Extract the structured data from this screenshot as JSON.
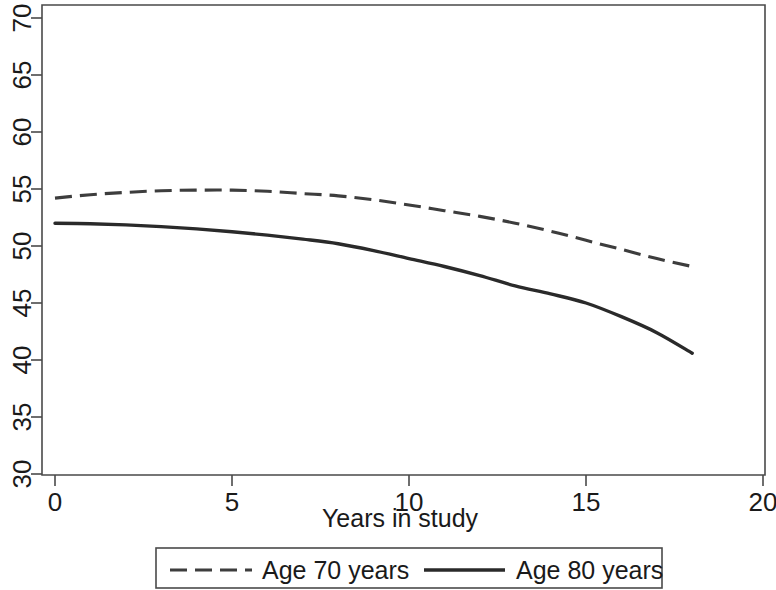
{
  "chart_data": {
    "type": "line",
    "title": "",
    "xlabel": "Years in study",
    "ylabel": "",
    "xlim": [
      0,
      20
    ],
    "ylim": [
      30,
      70
    ],
    "xticks": [
      0,
      5,
      10,
      15,
      20
    ],
    "xtick_labels": [
      "0",
      "5",
      "10",
      "15",
      "20"
    ],
    "yticks": [
      30,
      35,
      40,
      45,
      50,
      55,
      60,
      65,
      70
    ],
    "ytick_labels": [
      "30",
      "35",
      "40",
      "45",
      "50",
      "55",
      "60",
      "65",
      "70"
    ],
    "grid": false,
    "legend_position": "below-axes",
    "x": [
      0,
      1,
      2,
      3,
      4,
      5,
      6,
      7,
      8,
      9,
      10,
      11,
      12,
      13,
      14,
      15,
      16,
      17,
      18
    ],
    "series": [
      {
        "name": "Age 70 years",
        "style": "dashed",
        "color": "#3d3d3d",
        "values": [
          54.2,
          54.5,
          54.7,
          54.85,
          54.9,
          54.9,
          54.8,
          54.6,
          54.4,
          54.05,
          53.6,
          53.1,
          52.6,
          52.0,
          51.3,
          50.5,
          49.7,
          48.9,
          48.2
        ]
      },
      {
        "name": "Age 80 years",
        "style": "solid",
        "color": "#2a2a2a",
        "values": [
          52.0,
          51.95,
          51.85,
          51.7,
          51.5,
          51.25,
          50.95,
          50.6,
          50.2,
          49.6,
          48.9,
          48.2,
          47.4,
          46.5,
          45.8,
          45.0,
          43.8,
          42.4,
          40.6
        ]
      }
    ],
    "legend": [
      {
        "label": "Age 70 years",
        "style": "dashed"
      },
      {
        "label": "Age 80 years",
        "style": "solid"
      }
    ]
  },
  "geometry": {
    "plot_left": 42,
    "plot_right": 765,
    "plot_top": 5,
    "plot_bottom": 475,
    "x0_px": 55,
    "x_per_unit": 35.4,
    "y70_px": 18,
    "y_per_unit": 11.4
  }
}
